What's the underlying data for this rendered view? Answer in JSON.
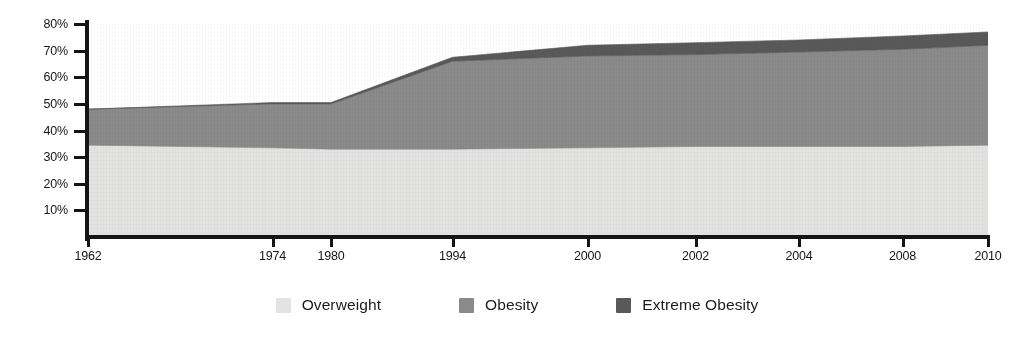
{
  "chart_data": {
    "type": "area",
    "stacked": true,
    "title": "",
    "subtitle": "",
    "xlabel": "",
    "ylabel": "",
    "grid": false,
    "legend_position": "bottom",
    "x": [
      1962,
      1974,
      1980,
      1994,
      2000,
      2002,
      2004,
      2008,
      2010
    ],
    "categories": [
      "1962",
      "1974",
      "1980",
      "1994",
      "2000",
      "2002",
      "2004",
      "2008",
      "2010"
    ],
    "x_tick_labels": [
      "1962",
      "1974",
      "1980",
      "1994",
      "2000",
      "2002",
      "2004",
      "2008",
      "2010"
    ],
    "x_tick_positions_frac": [
      0.0,
      0.205,
      0.27,
      0.405,
      0.555,
      0.675,
      0.79,
      0.905,
      1.0
    ],
    "xlim": [
      1962,
      2010
    ],
    "ylim": [
      0,
      80
    ],
    "y_ticks": [
      10,
      20,
      30,
      40,
      50,
      60,
      70,
      80
    ],
    "y_tick_labels": [
      "10%",
      "20%",
      "30%",
      "40%",
      "50%",
      "60%",
      "70%",
      "80%"
    ],
    "series": [
      {
        "name": "Overweight",
        "color": "#e3e3e1",
        "values": [
          34.5,
          33.5,
          33.0,
          33.0,
          33.5,
          34.0,
          34.0,
          34.0,
          34.5
        ]
      },
      {
        "name": "Obesity",
        "color": "#8a8a8a",
        "values": [
          13.5,
          16.5,
          17.0,
          33.0,
          34.5,
          34.5,
          35.5,
          36.5,
          37.5
        ]
      },
      {
        "name": "Extreme Obesity",
        "color": "#595959",
        "values": [
          0.0,
          0.5,
          0.5,
          1.5,
          4.0,
          4.5,
          4.5,
          5.0,
          5.0
        ]
      }
    ],
    "cumulative_tops": {
      "Overweight": [
        34.5,
        33.5,
        33.0,
        33.0,
        33.5,
        34.0,
        34.0,
        34.0,
        34.5
      ],
      "Overweight+Obesity": [
        48.0,
        50.0,
        50.0,
        66.0,
        68.0,
        68.5,
        69.5,
        70.5,
        72.0
      ],
      "Total": [
        48.0,
        50.5,
        50.5,
        67.5,
        72.0,
        73.0,
        74.0,
        75.5,
        77.0
      ]
    }
  },
  "legend": {
    "items": [
      {
        "label": "Overweight",
        "color": "#e3e3e1",
        "swatch_name": "legend-swatch-overweight"
      },
      {
        "label": "Obesity",
        "color": "#8a8a8a",
        "swatch_name": "legend-swatch-obesity"
      },
      {
        "label": "Extreme Obesity",
        "color": "#595959",
        "swatch_name": "legend-swatch-extreme-obesity"
      }
    ]
  },
  "colors": {
    "overweight": "#e3e3e1",
    "obesity": "#8a8a8a",
    "extreme_obesity": "#595959",
    "axis": "#151515",
    "background": "#ffffff",
    "text": "#1b1b1b"
  }
}
